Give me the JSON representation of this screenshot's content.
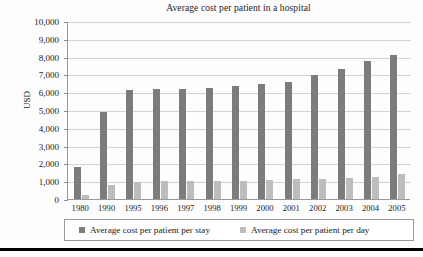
{
  "chart_data": {
    "type": "bar",
    "title": "Average cost per patient in a hospital",
    "xlabel": "",
    "ylabel": "USD",
    "ylim": [
      0,
      10000
    ],
    "ytick_labels": [
      "10,000",
      "9,000",
      "8,000",
      "7,000",
      "6,000",
      "5,000",
      "4,000",
      "3,000",
      "2,000",
      "1,000",
      "0"
    ],
    "ytick_values": [
      10000,
      9000,
      8000,
      7000,
      6000,
      5000,
      4000,
      3000,
      2000,
      1000,
      0
    ],
    "grid": true,
    "legend_position": "bottom",
    "categories": [
      "1980",
      "1990",
      "1995",
      "1996",
      "1997",
      "1998",
      "1999",
      "2000",
      "2001",
      "2002",
      "2003",
      "2004",
      "2005"
    ],
    "series": [
      {
        "name": "Average cost per patient per stay",
        "color": "#7c7c7c",
        "values": [
          1800,
          4900,
          6150,
          6200,
          6200,
          6250,
          6350,
          6450,
          6600,
          6950,
          7300,
          7750,
          8100
        ]
      },
      {
        "name": "Average cost per patient per day",
        "color": "#bdbdbd",
        "values": [
          230,
          780,
          980,
          990,
          1000,
          1010,
          1010,
          1050,
          1100,
          1150,
          1200,
          1250,
          1400
        ]
      }
    ]
  },
  "legend": {
    "stay_label": "Average cost per patient per stay",
    "day_label": "Average cost per patient per day"
  },
  "colors": {
    "series_stay": "#7c7c7c",
    "series_day": "#bdbdbd",
    "grid": "#d3d3d3",
    "axis": "#9a9a9a"
  }
}
